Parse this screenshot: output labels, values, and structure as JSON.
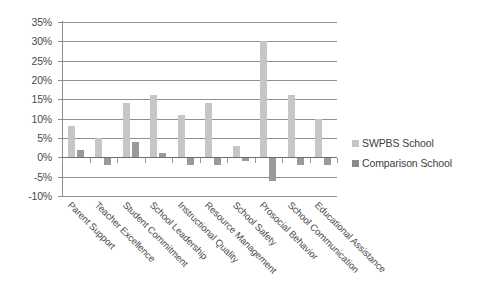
{
  "chart_data": {
    "type": "bar",
    "title": "",
    "subtitle": "",
    "xlabel": "",
    "ylabel": "",
    "ylim": [
      -10,
      35
    ],
    "ytick_step": 5,
    "ytick_labels": [
      "35%",
      "30%",
      "25%",
      "20%",
      "15%",
      "10%",
      "5%",
      "0%",
      "-5%",
      "-10%"
    ],
    "ytick_values": [
      35,
      30,
      25,
      20,
      15,
      10,
      5,
      0,
      -5,
      -10
    ],
    "grid": true,
    "legend_position": "right",
    "categories": [
      "Parent Support",
      "Teacher Excellence",
      "Student Commitment",
      "School Leadership",
      "Instructional Quality",
      "Resource Management",
      "School Safety",
      "Prosocial Behavior",
      "School Communication",
      "Educational Assistance"
    ],
    "series": [
      {
        "name": "SWPBS School",
        "color": "#c6c6c6",
        "values": [
          8,
          5,
          14,
          16,
          11,
          14,
          3,
          30,
          16,
          10
        ]
      },
      {
        "name": "Comparison School",
        "color": "#9a9a9a",
        "values": [
          2,
          -2,
          4,
          1,
          -2,
          -2,
          -1,
          -6,
          -2,
          -2
        ]
      }
    ]
  },
  "legend": {
    "items": [
      {
        "label": "SWPBS School",
        "color": "#c6c6c6"
      },
      {
        "label": "Comparison School",
        "color": "#8a8a8a"
      }
    ]
  }
}
